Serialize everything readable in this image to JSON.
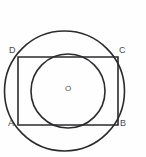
{
  "figure": {
    "background_color": "#fefefe",
    "stroke_color": "#2b2b2e",
    "label_color": "#4a4a4e",
    "top_cut_text": "",
    "labels": {
      "vertex_a": "A",
      "vertex_b": "B",
      "vertex_c": "C",
      "vertex_d": "D",
      "center": "O"
    }
  },
  "chart_data": {
    "type": "diagram",
    "title": "",
    "shapes": [
      {
        "name": "outer-circle",
        "kind": "circle",
        "cx": 64.5,
        "cy": 91,
        "r": 60,
        "stroke": "#2b2b2e",
        "stroke_width": 1.6,
        "fill": "none"
      },
      {
        "name": "rectangle-abcd",
        "kind": "rect",
        "x": 18,
        "y": 57,
        "width": 100,
        "height": 68,
        "stroke": "#2b2b2e",
        "stroke_width": 1.6,
        "fill": "none"
      },
      {
        "name": "inner-circle",
        "kind": "circle",
        "cx": 68,
        "cy": 91,
        "r": 37,
        "stroke": "#2b2b2e",
        "stroke_width": 1.6,
        "fill": "none"
      }
    ],
    "points": [
      {
        "label": "D",
        "x": 18,
        "y": 57,
        "role": "rectangle-top-left"
      },
      {
        "label": "C",
        "x": 118,
        "y": 57,
        "role": "rectangle-top-right"
      },
      {
        "label": "A",
        "x": 18,
        "y": 125,
        "role": "rectangle-bottom-left"
      },
      {
        "label": "B",
        "x": 118,
        "y": 125,
        "role": "rectangle-bottom-right"
      },
      {
        "label": "O",
        "x": 68,
        "y": 91,
        "role": "inner-circle-center"
      }
    ]
  }
}
